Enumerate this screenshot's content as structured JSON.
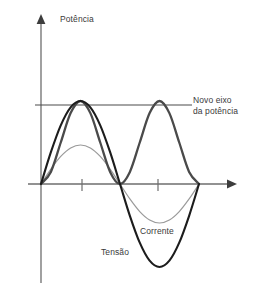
{
  "figure": {
    "title": "",
    "width": 253,
    "height": 283,
    "background": "#ffffff"
  },
  "labels": {
    "potencia": "Potência",
    "novo_eixo_line1": "Novo eixo",
    "novo_eixo_line2": "da potência",
    "corrente": "Corrente",
    "tensao": "Tensão"
  },
  "colors": {
    "power": "#4a4a4a",
    "voltage": "#1c1c1c",
    "current": "#9a9a9a",
    "axis": "#6e6e6e",
    "new_axis_line": "#4a4a4a",
    "text": "#3a3a3a",
    "background": "#ffffff"
  },
  "chart_data": {
    "type": "line",
    "title": "",
    "xlabel": "",
    "ylabel": "",
    "grid": false,
    "legend_position": "inline-annotations",
    "axes": {
      "x_axis": {
        "y_pixel": 184,
        "x_start": 28,
        "x_end": 237,
        "arrow": "right"
      },
      "y_axis": {
        "x_pixel": 41,
        "y_start": 15,
        "y_end": 283,
        "arrow": "up"
      },
      "x_ticks_pixels": [
        82,
        158
      ],
      "x_ticks_labels": [
        "",
        ""
      ],
      "new_power_axis": {
        "label": "Novo eixo da potência",
        "y_pixel": 105,
        "x_start": 35,
        "x_end": 192,
        "value": 0.5
      },
      "xlim": [
        0,
        2.0
      ],
      "ylim": [
        -1.05,
        1.05
      ],
      "x_unit": "períodos (ciclos de rede)"
    },
    "series": [
      {
        "name": "Potência",
        "label": "Potência",
        "color": "#4a4a4a",
        "stroke_width": 2.3,
        "formula": "p(t) = sin^2(pi * x) ,  x em meio-ciclos",
        "description": "Potência instantânea, sempre positiva, dois lóbulos; valor médio indicado pelo 'Novo eixo da potência'",
        "x": [
          0,
          0.125,
          0.25,
          0.375,
          0.5,
          0.625,
          0.75,
          0.875,
          1.0,
          1.125,
          1.25,
          1.375,
          1.5,
          1.625,
          1.75,
          1.875,
          2.0
        ],
        "y": [
          0,
          0.146,
          0.5,
          0.854,
          1.0,
          0.854,
          0.5,
          0.146,
          0,
          0.146,
          0.5,
          0.854,
          1.0,
          0.854,
          0.5,
          0.146,
          0
        ],
        "peaks": [
          {
            "x_pixel": 82,
            "y_pixel": 36,
            "value": 1.0
          },
          {
            "x_pixel": 156,
            "y_pixel": 36,
            "value": 1.0
          }
        ],
        "zeros_pixels": [
          41,
          121,
          199
        ]
      },
      {
        "name": "Tensão",
        "label": "Tensão",
        "color": "#1c1c1c",
        "stroke_width": 2.1,
        "formula": "v(t) = sin(pi * x)",
        "description": "Tensão senoidal de maior amplitude",
        "x": [
          0,
          0.125,
          0.25,
          0.375,
          0.5,
          0.625,
          0.75,
          0.875,
          1.0,
          1.125,
          1.25,
          1.375,
          1.5,
          1.625,
          1.75,
          1.875,
          2.0
        ],
        "y": [
          0,
          0.383,
          0.707,
          0.924,
          1.0,
          0.924,
          0.707,
          0.383,
          0,
          -0.383,
          -0.707,
          -0.924,
          -1.0,
          -0.924,
          -0.707,
          -0.383,
          0
        ],
        "peak": {
          "x_pixel": 83,
          "y_pixel": 101,
          "value": 1.0
        },
        "trough": {
          "x_pixel": 157,
          "y_pixel": 270,
          "value": -1.0
        },
        "zeros_pixels": [
          41,
          121,
          199
        ]
      },
      {
        "name": "Corrente",
        "label": "Corrente",
        "color": "#9a9a9a",
        "stroke_width": 1.2,
        "formula": "i(t) = 0.47 * sin(pi * x)",
        "description": "Corrente senoidal em fase com a tensão, amplitude menor",
        "x": [
          0,
          0.125,
          0.25,
          0.375,
          0.5,
          0.625,
          0.75,
          0.875,
          1.0,
          1.125,
          1.25,
          1.375,
          1.5,
          1.625,
          1.75,
          1.875,
          2.0
        ],
        "y": [
          0,
          0.18,
          0.332,
          0.434,
          0.47,
          0.434,
          0.332,
          0.18,
          0,
          -0.18,
          -0.332,
          -0.434,
          -0.47,
          -0.434,
          -0.332,
          -0.18,
          0
        ],
        "peak": {
          "x_pixel": 80,
          "y_pixel": 145,
          "value": 0.47
        },
        "trough": {
          "x_pixel": 157,
          "y_pixel": 222,
          "value": -0.47
        },
        "zeros_pixels": [
          41,
          121,
          199
        ]
      }
    ],
    "annotations": [
      {
        "name": "potencia",
        "text": "Potência",
        "x_pixel": 60,
        "y_pixel": 14
      },
      {
        "name": "novo-eixo",
        "text": "Novo eixo da potência",
        "x_pixel": 193,
        "y_pixel": 95
      },
      {
        "name": "corrente",
        "text": "Corrente",
        "x_pixel": 140,
        "y_pixel": 226
      },
      {
        "name": "tensao",
        "text": "Tensão",
        "x_pixel": 101,
        "y_pixel": 247
      }
    ]
  }
}
